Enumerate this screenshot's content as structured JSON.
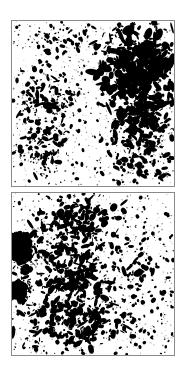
{
  "figure": {
    "kind": "two-panel-micrograph",
    "background_color": "#ffffff",
    "particle_color": "#000000",
    "border_color": "#8a8a8a",
    "width": 186,
    "height": 375,
    "caption": ""
  },
  "panels": [
    {
      "id": "panel-top",
      "label": "",
      "x": 11,
      "y": 20,
      "width": 164,
      "height": 167,
      "description": "Scattered dark particles with a dense aggregated cluster occupying the upper-right quadrant",
      "regions": [
        {
          "name": "upper-right-dense-cluster",
          "cx": 0.78,
          "cy": 0.28,
          "rx": 0.24,
          "ry": 0.26,
          "count": 430,
          "size_min": 1.2,
          "size_max": 5.4,
          "elongation": 1.7,
          "seed": 1101
        },
        {
          "name": "right-mid-cluster",
          "cx": 0.8,
          "cy": 0.58,
          "rx": 0.2,
          "ry": 0.22,
          "count": 210,
          "size_min": 1.0,
          "size_max": 4.2,
          "elongation": 1.6,
          "seed": 1102
        },
        {
          "name": "right-lower-scatter",
          "cx": 0.8,
          "cy": 0.84,
          "rx": 0.2,
          "ry": 0.16,
          "count": 95,
          "size_min": 0.9,
          "size_max": 3.4,
          "elongation": 1.5,
          "seed": 1103
        },
        {
          "name": "left-mid-band",
          "cx": 0.22,
          "cy": 0.46,
          "rx": 0.17,
          "ry": 0.2,
          "count": 120,
          "size_min": 0.8,
          "size_max": 3.0,
          "elongation": 1.6,
          "seed": 1104
        },
        {
          "name": "left-lower-band",
          "cx": 0.2,
          "cy": 0.76,
          "rx": 0.16,
          "ry": 0.18,
          "count": 110,
          "size_min": 0.8,
          "size_max": 3.2,
          "elongation": 1.6,
          "seed": 1105
        },
        {
          "name": "top-left-sparse",
          "cx": 0.3,
          "cy": 0.1,
          "rx": 0.26,
          "ry": 0.1,
          "count": 55,
          "size_min": 0.7,
          "size_max": 2.8,
          "elongation": 1.4,
          "seed": 1106
        },
        {
          "name": "uniform-background-scatter",
          "cx": 0.5,
          "cy": 0.5,
          "rx": 0.52,
          "ry": 0.52,
          "count": 330,
          "size_min": 0.6,
          "size_max": 2.4,
          "elongation": 1.3,
          "seed": 1107,
          "uniform": true
        },
        {
          "name": "faint-speckle",
          "cx": 0.5,
          "cy": 0.5,
          "rx": 0.52,
          "ry": 0.52,
          "count": 520,
          "size_min": 0.4,
          "size_max": 1.0,
          "elongation": 1.0,
          "seed": 1108,
          "uniform": true,
          "opacity": 0.45
        }
      ],
      "blobs": []
    },
    {
      "id": "panel-bottom",
      "label": "",
      "x": 11,
      "y": 192,
      "width": 164,
      "height": 164,
      "description": "Scattered dark particles with two large solid aggregates against the left border and a dense center-left field",
      "regions": [
        {
          "name": "center-left-dense-field",
          "cx": 0.38,
          "cy": 0.44,
          "rx": 0.28,
          "ry": 0.34,
          "count": 340,
          "size_min": 1.0,
          "size_max": 4.4,
          "elongation": 1.7,
          "seed": 2201
        },
        {
          "name": "upper-center-band",
          "cx": 0.4,
          "cy": 0.14,
          "rx": 0.28,
          "ry": 0.12,
          "count": 130,
          "size_min": 0.9,
          "size_max": 3.4,
          "elongation": 1.6,
          "seed": 2202
        },
        {
          "name": "lower-center-band",
          "cx": 0.42,
          "cy": 0.8,
          "rx": 0.3,
          "ry": 0.16,
          "count": 190,
          "size_min": 0.9,
          "size_max": 3.8,
          "elongation": 1.7,
          "seed": 2203
        },
        {
          "name": "left-edge-scatter",
          "cx": 0.08,
          "cy": 0.55,
          "rx": 0.1,
          "ry": 0.4,
          "count": 95,
          "size_min": 0.9,
          "size_max": 3.6,
          "elongation": 1.8,
          "seed": 2204
        },
        {
          "name": "right-sparse-field",
          "cx": 0.8,
          "cy": 0.5,
          "rx": 0.2,
          "ry": 0.44,
          "count": 75,
          "size_min": 0.8,
          "size_max": 2.8,
          "elongation": 1.4,
          "seed": 2205
        },
        {
          "name": "uniform-background-scatter",
          "cx": 0.5,
          "cy": 0.5,
          "rx": 0.52,
          "ry": 0.52,
          "count": 300,
          "size_min": 0.6,
          "size_max": 2.4,
          "elongation": 1.3,
          "seed": 2206,
          "uniform": true
        },
        {
          "name": "faint-speckle",
          "cx": 0.5,
          "cy": 0.5,
          "rx": 0.52,
          "ry": 0.52,
          "count": 480,
          "size_min": 0.4,
          "size_max": 1.0,
          "elongation": 1.0,
          "seed": 2207,
          "uniform": true,
          "opacity": 0.45
        }
      ],
      "blobs": [
        {
          "name": "large-aggregate-upper-left",
          "cx": 0.045,
          "cy": 0.335,
          "rx": 0.082,
          "ry": 0.105,
          "lobes": 7,
          "roughness": 0.26,
          "seed": 2301
        },
        {
          "name": "large-aggregate-lower-left",
          "cx": 0.035,
          "cy": 0.605,
          "rx": 0.06,
          "ry": 0.072,
          "lobes": 6,
          "roughness": 0.3,
          "seed": 2302
        }
      ]
    }
  ]
}
